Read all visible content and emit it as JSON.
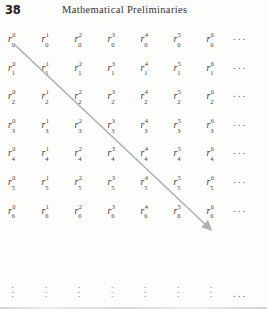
{
  "page": {
    "folio": "38",
    "running_head": "Mathematical Preliminaries",
    "background_color": "#fdfdfb",
    "text_color": "#3a3a3a"
  },
  "matrix": {
    "symbol": "r",
    "row_ellipsis": "...",
    "column_ellipsis": "⋮",
    "rows": [
      {
        "subscript": "0",
        "cells": [
          {
            "base": "r",
            "sup": "0",
            "sub": "0"
          },
          {
            "base": "r",
            "sup": "1",
            "sub": "0"
          },
          {
            "base": "r",
            "sup": "2",
            "sub": "0"
          },
          {
            "base": "r",
            "sup": "3",
            "sub": "0"
          },
          {
            "base": "r",
            "sup": "4",
            "sub": "0"
          },
          {
            "base": "r",
            "sup": "5",
            "sub": "0"
          },
          {
            "base": "r",
            "sup": "6",
            "sub": "0"
          }
        ]
      },
      {
        "subscript": "1",
        "cells": [
          {
            "base": "r",
            "sup": "0",
            "sub": "1"
          },
          {
            "base": "r",
            "sup": "1",
            "sub": "1"
          },
          {
            "base": "r",
            "sup": "2",
            "sub": "1"
          },
          {
            "base": "r",
            "sup": "3",
            "sub": "1"
          },
          {
            "base": "r",
            "sup": "4",
            "sub": "1"
          },
          {
            "base": "r",
            "sup": "5",
            "sub": "1"
          },
          {
            "base": "r",
            "sup": "6",
            "sub": "1"
          }
        ]
      },
      {
        "subscript": "2",
        "cells": [
          {
            "base": "r",
            "sup": "0",
            "sub": "2"
          },
          {
            "base": "r",
            "sup": "1",
            "sub": "2"
          },
          {
            "base": "r",
            "sup": "2",
            "sub": "2"
          },
          {
            "base": "r",
            "sup": "3",
            "sub": "2"
          },
          {
            "base": "r",
            "sup": "4",
            "sub": "2"
          },
          {
            "base": "r",
            "sup": "5",
            "sub": "2"
          },
          {
            "base": "r",
            "sup": "6",
            "sub": "2"
          }
        ]
      },
      {
        "subscript": "3",
        "cells": [
          {
            "base": "r",
            "sup": "0",
            "sub": "3"
          },
          {
            "base": "r",
            "sup": "1",
            "sub": "3"
          },
          {
            "base": "r",
            "sup": "2",
            "sub": "3"
          },
          {
            "base": "r",
            "sup": "3",
            "sub": "3"
          },
          {
            "base": "r",
            "sup": "4",
            "sub": "3"
          },
          {
            "base": "r",
            "sup": "5",
            "sub": "3"
          },
          {
            "base": "r",
            "sup": "6",
            "sub": "3"
          }
        ]
      },
      {
        "subscript": "4",
        "cells": [
          {
            "base": "r",
            "sup": "0",
            "sub": "4"
          },
          {
            "base": "r",
            "sup": "1",
            "sub": "4"
          },
          {
            "base": "r",
            "sup": "2",
            "sub": "4"
          },
          {
            "base": "r",
            "sup": "3",
            "sub": "4"
          },
          {
            "base": "r",
            "sup": "4",
            "sub": "4"
          },
          {
            "base": "r",
            "sup": "5",
            "sub": "4"
          },
          {
            "base": "r",
            "sup": "6",
            "sub": "4"
          }
        ]
      },
      {
        "subscript": "5",
        "cells": [
          {
            "base": "r",
            "sup": "0",
            "sub": "5"
          },
          {
            "base": "r",
            "sup": "1",
            "sub": "5"
          },
          {
            "base": "r",
            "sup": "2",
            "sub": "5"
          },
          {
            "base": "r",
            "sup": "3",
            "sub": "5"
          },
          {
            "base": "r",
            "sup": "4",
            "sub": "5"
          },
          {
            "base": "r",
            "sup": "5",
            "sub": "5"
          },
          {
            "base": "r",
            "sup": "6",
            "sub": "5"
          }
        ]
      },
      {
        "subscript": "6",
        "cells": [
          {
            "base": "r",
            "sup": "0",
            "sub": "6"
          },
          {
            "base": "r",
            "sup": "1",
            "sub": "6"
          },
          {
            "base": "r",
            "sup": "2",
            "sub": "6"
          },
          {
            "base": "r",
            "sup": "3",
            "sub": "6"
          },
          {
            "base": "r",
            "sup": "4",
            "sub": "6"
          },
          {
            "base": "r",
            "sup": "5",
            "sub": "6"
          },
          {
            "base": "r",
            "sup": "6",
            "sub": "6"
          }
        ]
      }
    ]
  },
  "arrow": {
    "color": "#b2b2b2",
    "from_cell": "r_0^0",
    "to_cell": "r_6^6"
  }
}
